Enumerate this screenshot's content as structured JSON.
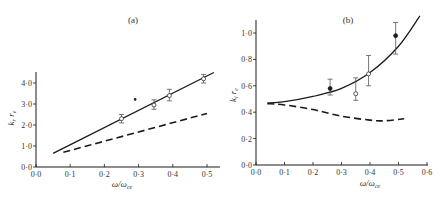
{
  "figure": {
    "background": "#ffffff",
    "ink": "#1a1a1a"
  },
  "chart_data": [
    {
      "type": "line",
      "title": "(a)",
      "xlabel": "ω/ω_ce",
      "ylabel": "k_r r_e",
      "xlim": [
        0.0,
        0.53
      ],
      "ylim": [
        0.0,
        4.6
      ],
      "grid": false,
      "legend": "none",
      "xticks": [
        0.0,
        0.1,
        0.2,
        0.3,
        0.4,
        0.5
      ],
      "xtick_labels": [
        "0·0",
        "0·1",
        "0·2",
        "0·3",
        "0·4",
        "0·5"
      ],
      "yticks": [
        0.0,
        1.0,
        2.0,
        3.0,
        4.0
      ],
      "ytick_labels": [
        "0·0",
        "1·0",
        "2·0",
        "3·0",
        "4·0"
      ],
      "series": [
        {
          "name": "theory (solid)",
          "style": "solid",
          "x": [
            0.05,
            0.52
          ],
          "y": [
            0.65,
            4.5
          ]
        },
        {
          "name": "theory (dashed)",
          "style": "dashed",
          "x": [
            0.08,
            0.5
          ],
          "y": [
            0.7,
            2.55
          ]
        },
        {
          "name": "measured",
          "style": "open-circle-errorbar",
          "x": [
            0.25,
            0.345,
            0.39,
            0.49
          ],
          "y": [
            2.3,
            2.95,
            3.4,
            4.2
          ],
          "yerr_low": [
            2.1,
            2.75,
            3.15,
            4.0
          ],
          "yerr_high": [
            2.5,
            3.2,
            3.7,
            4.4
          ]
        },
        {
          "name": "stray mark",
          "style": "dot",
          "x": [
            0.29
          ],
          "y": [
            3.22
          ]
        }
      ]
    },
    {
      "type": "line",
      "title": "(b)",
      "xlabel": "ω/ω_ce",
      "ylabel": "k_i r_e",
      "xlim": [
        0.0,
        0.6
      ],
      "ylim": [
        0.0,
        1.1
      ],
      "grid": false,
      "legend": "none",
      "xticks": [
        0.0,
        0.1,
        0.2,
        0.3,
        0.4,
        0.5,
        0.6
      ],
      "xtick_labels": [
        "0·0",
        "0·1",
        "0·2",
        "0·3",
        "0·4",
        "0·5",
        "0·6"
      ],
      "yticks": [
        0.0,
        0.2,
        0.4,
        0.6,
        0.8,
        1.0
      ],
      "ytick_labels": [
        "0·0",
        "0·2",
        "0·4",
        "0·6",
        "0·8",
        "1·0"
      ],
      "series": [
        {
          "name": "theory (solid)",
          "style": "solid",
          "x": [
            0.04,
            0.1,
            0.2,
            0.3,
            0.4,
            0.5,
            0.575
          ],
          "y": [
            0.47,
            0.48,
            0.52,
            0.58,
            0.7,
            0.9,
            1.13
          ]
        },
        {
          "name": "theory (dashed)",
          "style": "dashed",
          "x": [
            0.04,
            0.1,
            0.2,
            0.3,
            0.4,
            0.45,
            0.52
          ],
          "y": [
            0.465,
            0.455,
            0.42,
            0.37,
            0.34,
            0.335,
            0.35
          ]
        },
        {
          "name": "measured (filled)",
          "style": "filled-circle-errorbar",
          "x": [
            0.26,
            0.49
          ],
          "y": [
            0.58,
            0.98
          ],
          "yerr_low": [
            0.53,
            0.84
          ],
          "yerr_high": [
            0.65,
            1.08
          ]
        },
        {
          "name": "measured (open)",
          "style": "open-circle-errorbar",
          "x": [
            0.35,
            0.395
          ],
          "y": [
            0.54,
            0.69
          ],
          "yerr_low": [
            0.49,
            0.6
          ],
          "yerr_high": [
            0.66,
            0.83
          ]
        }
      ]
    }
  ],
  "labels": {
    "a": {
      "title": "(a)",
      "ylabel_main": "k",
      "ylabel_sub1": "r",
      "ylabel_mid": " r",
      "ylabel_sub2": "e",
      "xlabel_main": "ω/ω",
      "xlabel_sub": "ce"
    },
    "b": {
      "title": "(b)",
      "ylabel_main": "k",
      "ylabel_sub1": "i",
      "ylabel_mid": " r",
      "ylabel_sub2": "e",
      "xlabel_main": "ω/ω",
      "xlabel_sub": "ce"
    }
  }
}
